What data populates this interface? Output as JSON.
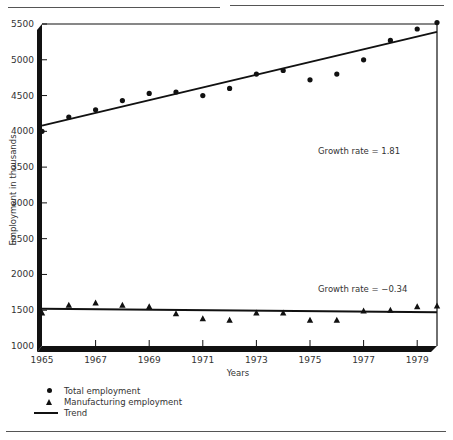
{
  "chart_data": {
    "type": "scatter",
    "title": "",
    "xlabel": "Years",
    "ylabel": "Employment in thousands",
    "xlim": [
      1965,
      1980
    ],
    "ylim": [
      1000,
      5500
    ],
    "x_ticks": [
      1965,
      1967,
      1969,
      1971,
      1973,
      1975,
      1977,
      1979
    ],
    "y_ticks": [
      1000,
      1500,
      2000,
      2500,
      3000,
      3500,
      4000,
      4500,
      5000,
      5500
    ],
    "grid": false,
    "legend_position": "bottom-left",
    "x": [
      1965,
      1966,
      1967,
      1968,
      1969,
      1970,
      1971,
      1972,
      1973,
      1974,
      1975,
      1976,
      1977,
      1978,
      1979,
      1980
    ],
    "series": [
      {
        "name": "Total employment",
        "marker": "circle",
        "values": [
          4000,
          4200,
          4300,
          4430,
          4530,
          4550,
          4500,
          4600,
          4800,
          4850,
          4720,
          4800,
          5000,
          5270,
          5430,
          5520
        ]
      },
      {
        "name": "Manufacturing employment",
        "marker": "triangle",
        "values": [
          1460,
          1570,
          1600,
          1570,
          1550,
          1450,
          1380,
          1360,
          1460,
          1460,
          1360,
          1360,
          1490,
          1500,
          1550,
          1560
        ]
      }
    ],
    "trends": [
      {
        "name": "Trend (Total employment)",
        "start": [
          1965,
          4080
        ],
        "end": [
          1980,
          5390
        ],
        "annotation": "Growth rate  =  1.81"
      },
      {
        "name": "Trend (Manufacturing employment)",
        "start": [
          1965,
          1520
        ],
        "end": [
          1980,
          1470
        ],
        "annotation": "Growth rate  =  −0.34"
      }
    ],
    "legend": [
      "Total employment",
      "Manufacturing employment",
      "Trend"
    ]
  },
  "legend": {
    "total": "Total employment",
    "manufacturing": "Manufacturing employment",
    "trend": "Trend"
  },
  "annotations": {
    "total_growth": "Growth rate  =  1.81",
    "manufacturing_growth": "Growth rate  =  −0.34"
  },
  "axes": {
    "xlabel": "Years",
    "ylabel": "Employment in thousands"
  }
}
